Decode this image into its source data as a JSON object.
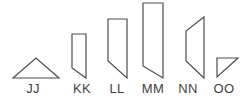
{
  "figure": {
    "background": "#ffffff",
    "stroke_color": "#4d4d4d",
    "label_color": "#3f3f3f",
    "label_y": 93,
    "shapes": [
      {
        "label": "JJ",
        "kind": "isosceles-triangle",
        "points": "13,78 36,58 59,78",
        "label_x": 33
      },
      {
        "label": "KK",
        "kind": "bar-slanted-bottom",
        "points": "72,34 86,34 86,78 72,68",
        "label_x": 82
      },
      {
        "label": "LL",
        "kind": "bar-slanted-bottom",
        "points": "108,19 127,19 127,78 108,61",
        "label_x": 117
      },
      {
        "label": "MM",
        "kind": "bar-slanted-bottom",
        "points": "143,3 163,3 163,78 143,66",
        "label_x": 153
      },
      {
        "label": "NN",
        "kind": "left-facing-trapezoid",
        "points": "204,17 186,31 186,61 204,78",
        "label_x": 188
      },
      {
        "label": "OO",
        "kind": "right-triangle",
        "points": "217,58 238,58 217,77",
        "label_x": 224
      }
    ]
  }
}
